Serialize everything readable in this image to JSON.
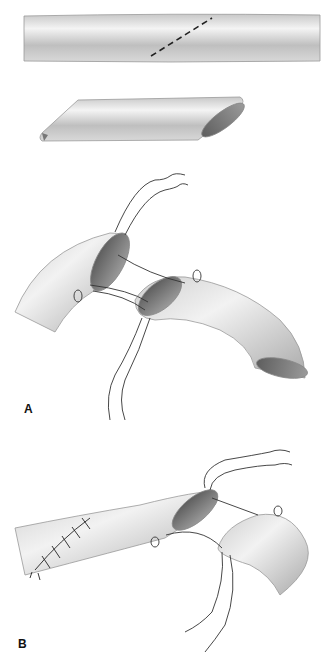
{
  "figure": {
    "panels": [
      {
        "label": "A",
        "description": "Vessel with diagonal dashed cut line; beveled graft segment; end-to-end anastomosis with stay sutures"
      },
      {
        "label": "B",
        "description": "Partially completed anastomosis with running suture, second vessel end with stay sutures"
      }
    ]
  },
  "colors": {
    "vessel_light": "#e6e6e6",
    "vessel_mid": "#bdbdbd",
    "vessel_dark": "#8a8a8a",
    "lumen": "#6f6f6f",
    "suture": "#333333",
    "cut_line": "#222222"
  }
}
